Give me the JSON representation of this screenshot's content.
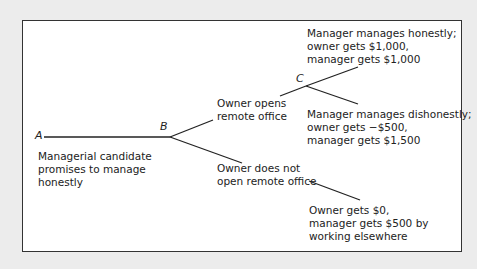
{
  "diagram": {
    "type": "game-tree",
    "nodes": [
      {
        "id": "A",
        "label": "A"
      },
      {
        "id": "B",
        "label": "B"
      },
      {
        "id": "C",
        "label": "C"
      }
    ],
    "labels": {
      "a_action": [
        "Managerial candidate",
        "promises to manage",
        "honestly"
      ],
      "b_upper": [
        "Owner opens",
        "remote office"
      ],
      "b_lower": [
        "Owner does not",
        "open remote office"
      ],
      "c_upper": [
        "Manager manages honestly;",
        "owner gets $1,000,",
        "manager gets $1,000"
      ],
      "c_lower": [
        "Manager manages dishonestly;",
        "owner gets −$500,",
        "manager gets $1,500"
      ],
      "b_lower_payoff": [
        "Owner gets $0,",
        "manager gets $500 by",
        "working elsewhere"
      ]
    },
    "edges": [
      {
        "from": "A",
        "to": "B",
        "label": "Managerial candidate promises to manage honestly"
      },
      {
        "from": "B",
        "to": "C",
        "label": "Owner opens remote office"
      },
      {
        "from": "B",
        "to": "end-0",
        "label": "Owner does not open remote office",
        "payoff": "Owner gets $0, manager gets $500 by working elsewhere"
      },
      {
        "from": "C",
        "to": "end-honest",
        "payoff": "Manager manages honestly; owner gets $1,000, manager gets $1,000"
      },
      {
        "from": "C",
        "to": "end-dishonest",
        "payoff": "Manager manages dishonestly; owner gets −$500, manager gets $1,500"
      }
    ]
  }
}
